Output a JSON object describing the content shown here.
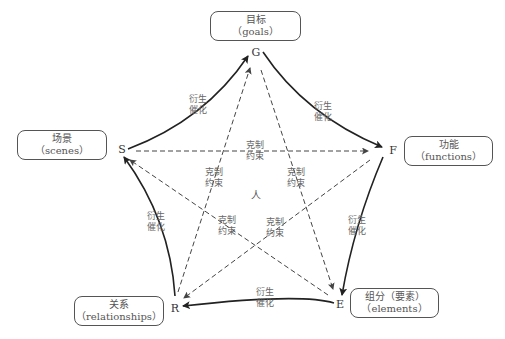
{
  "diagram": {
    "center_label": "人",
    "nodes": {
      "G": {
        "letter": "G",
        "title": "目标",
        "subtitle": "（goals）"
      },
      "F": {
        "letter": "F",
        "title": "功能",
        "subtitle": "（functions）"
      },
      "E": {
        "letter": "E",
        "title": "组分（要素）",
        "subtitle": "（elements）"
      },
      "R": {
        "letter": "R",
        "title": "关系",
        "subtitle": "（relationships）"
      },
      "S": {
        "letter": "S",
        "title": "场景",
        "subtitle": "（scenes）"
      }
    },
    "solid_edges": [
      {
        "from": "S",
        "to": "G",
        "label1": "衍生",
        "label2": "催化"
      },
      {
        "from": "G",
        "to": "F",
        "label1": "衍生",
        "label2": "催化"
      },
      {
        "from": "F",
        "to": "E",
        "label1": "衍生",
        "label2": "催化"
      },
      {
        "from": "E",
        "to": "R",
        "label1": "衍生",
        "label2": "催化"
      },
      {
        "from": "R",
        "to": "S",
        "label1": "衍生",
        "label2": "催化"
      }
    ],
    "dashed_edges": [
      {
        "from": "S",
        "to": "F",
        "label1": "克制",
        "label2": "约束"
      },
      {
        "from": "R",
        "to": "G",
        "label1": "克制",
        "label2": "约束"
      },
      {
        "from": "G",
        "to": "E",
        "label1": "克制",
        "label2": "约束"
      },
      {
        "from": "E",
        "to": "S",
        "label1": "克制",
        "label2": "约束"
      },
      {
        "from": "F",
        "to": "R",
        "label1": "克制",
        "label2": "约束"
      }
    ]
  }
}
